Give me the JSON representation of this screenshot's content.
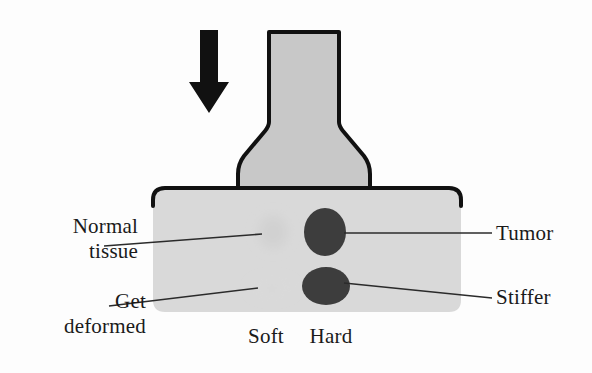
{
  "figure": {
    "type": "schematic-diagram",
    "background_color": "#fdfdfd"
  },
  "colors": {
    "probe_fill": "#c8c8c8",
    "probe_stroke": "#111111",
    "tissue_block_fill": "#d9d9d9",
    "tissue_block_stroke": "#111111",
    "normal_inclusion_fill": "#d2d2d2",
    "deformed_inclusion_fill": "#dcdcdc",
    "tumor_fill": "#3d3d3d",
    "stiffer_fill": "#3d3d3d",
    "arrow_fill": "#111111",
    "leader_line": "#2b2b2b",
    "text": "#1a1a1a"
  },
  "shapes": {
    "force_arrow": {
      "name": "downward-force-arrow",
      "direction": "down"
    },
    "probe": {
      "name": "indenter-probe",
      "description": "flask shaped compression probe pressing down on tissue"
    },
    "tissue_block": {
      "name": "tissue-block",
      "description": "rounded rectangle of soft tissue"
    },
    "inclusions": [
      {
        "name": "normal-tissue-inclusion",
        "state": "soft",
        "row": "upper"
      },
      {
        "name": "tumor-inclusion",
        "state": "hard",
        "row": "upper"
      },
      {
        "name": "deformed-inclusion",
        "state": "soft-deformed",
        "row": "lower"
      },
      {
        "name": "stiffer-inclusion",
        "state": "hard",
        "row": "lower"
      }
    ]
  },
  "labels": {
    "normal_tissue": "Normal\ntissue",
    "get_deformed": "Get\ndeformed",
    "tumor": "Tumor",
    "stiffer": "Stiffer",
    "soft": "Soft",
    "hard": "Hard"
  }
}
